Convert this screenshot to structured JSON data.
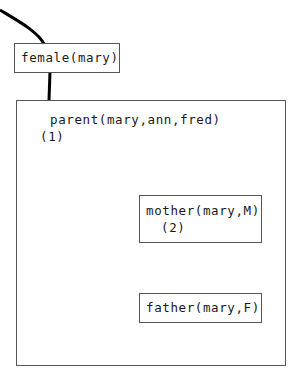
{
  "diagram": {
    "type": "proof-tree",
    "nodes": {
      "female": {
        "label": "female(mary)"
      },
      "parent_clause": {
        "label": "parent(mary,ann,fred)",
        "marker": "(1)"
      },
      "mother": {
        "label": "mother(mary,M)",
        "marker": "(2)"
      },
      "father": {
        "label": "father(mary,F)"
      }
    },
    "edges": [
      {
        "from": "top",
        "to": "female",
        "style": "thick-curve"
      },
      {
        "from": "female",
        "to": "parent_clause",
        "style": "thick-line"
      },
      {
        "from": "parent_clause",
        "to": "mother",
        "style": "thick-curve"
      },
      {
        "from": "mother",
        "to": "father",
        "style": "arrow-with-dot"
      }
    ],
    "colors": {
      "line": "#000000",
      "box_border": "#555555",
      "text": "#1a1a1a"
    }
  }
}
